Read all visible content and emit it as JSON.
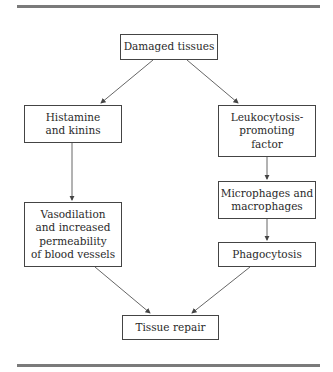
{
  "diagram": {
    "nodes": [
      {
        "id": "damaged",
        "label": "Damaged tissues"
      },
      {
        "id": "histamine",
        "label": "Histamine\nand kinins"
      },
      {
        "id": "leukocytosis",
        "label": "Leukocytosis-\npromoting\nfactor"
      },
      {
        "id": "microphages",
        "label": "Microphages and\nmacrophages"
      },
      {
        "id": "vasodilation",
        "label": "Vasodilation\nand increased\npermeability\nof blood vessels"
      },
      {
        "id": "phagocytosis",
        "label": "Phagocytosis"
      },
      {
        "id": "repair",
        "label": "Tissue repair"
      }
    ],
    "edges": [
      {
        "from": "damaged",
        "to": "histamine"
      },
      {
        "from": "damaged",
        "to": "leukocytosis"
      },
      {
        "from": "histamine",
        "to": "vasodilation"
      },
      {
        "from": "leukocytosis",
        "to": "microphages"
      },
      {
        "from": "microphages",
        "to": "phagocytosis"
      },
      {
        "from": "vasodilation",
        "to": "repair"
      },
      {
        "from": "phagocytosis",
        "to": "repair"
      }
    ]
  }
}
